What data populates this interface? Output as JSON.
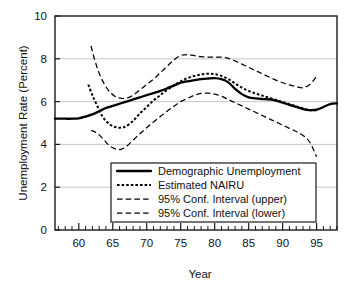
{
  "chart_data": {
    "type": "line",
    "title": "",
    "xlabel": "Year",
    "ylabel": "Unemployment Rate (Percent)",
    "xlim": [
      56.5,
      98.0
    ],
    "ylim": [
      0,
      10
    ],
    "yticks": [
      0,
      2,
      4,
      6,
      8,
      10
    ],
    "ytick_labels": [
      "0",
      "2",
      "4",
      "6",
      "8",
      "10"
    ],
    "xticks": [
      60,
      65,
      70,
      75,
      80,
      85,
      90,
      95
    ],
    "xtick_labels": [
      "60",
      "65",
      "70",
      "75",
      "80",
      "85",
      "90",
      "95"
    ],
    "xminor_step": 1,
    "grid": "horizontal",
    "legend_position": "lower-center",
    "series": [
      {
        "name": "Demographic Unemployment",
        "style": "solid",
        "x": [
          56.5,
          58,
          59,
          60,
          61,
          62,
          63,
          64,
          65,
          66,
          67,
          68,
          69,
          70,
          71,
          72,
          73,
          74,
          75,
          76,
          77,
          78,
          79,
          80,
          81,
          82,
          83,
          84,
          85,
          86,
          87,
          88,
          89,
          90,
          91,
          92,
          93,
          94,
          95,
          96,
          97,
          98
        ],
        "y": [
          5.2,
          5.2,
          5.2,
          5.22,
          5.3,
          5.4,
          5.55,
          5.7,
          5.8,
          5.9,
          6.0,
          6.1,
          6.2,
          6.3,
          6.4,
          6.5,
          6.62,
          6.75,
          6.88,
          6.95,
          7.0,
          7.05,
          7.08,
          7.1,
          7.05,
          6.9,
          6.6,
          6.35,
          6.2,
          6.15,
          6.12,
          6.1,
          6.05,
          5.95,
          5.85,
          5.75,
          5.65,
          5.6,
          5.62,
          5.75,
          5.88,
          5.92
        ]
      },
      {
        "name": "Estimated NAIRU",
        "style": "dotted",
        "x": [
          61.4,
          62,
          62.5,
          63,
          63.5,
          64,
          64.5,
          65,
          65.5,
          66,
          66.5,
          67,
          68,
          69,
          70,
          71,
          72,
          73,
          74,
          75,
          76,
          77,
          78,
          79,
          80,
          81,
          82,
          83,
          84,
          85,
          86,
          87,
          88,
          89,
          90,
          91,
          92,
          93,
          94,
          95
        ],
        "y": [
          6.8,
          6.3,
          5.95,
          5.6,
          5.3,
          5.1,
          4.95,
          4.85,
          4.8,
          4.78,
          4.8,
          4.85,
          5.1,
          5.45,
          5.75,
          6.05,
          6.3,
          6.55,
          6.75,
          6.95,
          7.1,
          7.2,
          7.27,
          7.3,
          7.28,
          7.2,
          7.05,
          6.85,
          6.65,
          6.5,
          6.38,
          6.28,
          6.18,
          6.08,
          5.98,
          5.88,
          5.78,
          5.68,
          5.6,
          5.6
        ]
      },
      {
        "name": "95% Conf. Interval (upper)",
        "style": "dashed",
        "x": [
          61.8,
          62.3,
          62.8,
          63.3,
          63.8,
          64.3,
          64.8,
          65.3,
          65.8,
          66.3,
          67,
          68,
          69,
          70,
          71,
          72,
          73,
          74,
          75,
          76,
          77,
          78,
          79,
          80,
          81,
          82,
          83,
          84,
          85,
          86,
          87,
          88,
          89,
          90,
          91,
          92,
          93,
          94,
          95
        ],
        "y": [
          8.6,
          8.0,
          7.5,
          7.1,
          6.8,
          6.55,
          6.38,
          6.25,
          6.18,
          6.15,
          6.15,
          6.3,
          6.55,
          6.8,
          7.05,
          7.35,
          7.65,
          7.95,
          8.15,
          8.2,
          8.15,
          8.1,
          8.08,
          8.08,
          8.08,
          8.02,
          7.9,
          7.75,
          7.6,
          7.45,
          7.3,
          7.15,
          7.0,
          6.88,
          6.78,
          6.7,
          6.65,
          6.8,
          7.18
        ]
      },
      {
        "name": "95% Conf. Interval (lower)",
        "style": "dashed",
        "x": [
          61.8,
          62.3,
          62.8,
          63.3,
          63.8,
          64.3,
          64.8,
          65.3,
          65.8,
          66.3,
          67,
          68,
          69,
          70,
          71,
          72,
          73,
          74,
          75,
          76,
          77,
          78,
          79,
          80,
          81,
          82,
          83,
          84,
          85,
          86,
          87,
          88,
          89,
          90,
          91,
          92,
          93,
          94,
          95
        ],
        "y": [
          4.65,
          4.6,
          4.5,
          4.35,
          4.18,
          4.0,
          3.88,
          3.8,
          3.76,
          3.78,
          3.9,
          4.2,
          4.5,
          4.78,
          5.05,
          5.3,
          5.55,
          5.78,
          6.0,
          6.15,
          6.3,
          6.38,
          6.4,
          6.35,
          6.25,
          6.1,
          5.95,
          5.8,
          5.65,
          5.5,
          5.35,
          5.2,
          5.05,
          4.9,
          4.75,
          4.6,
          4.42,
          4.1,
          3.42
        ]
      }
    ]
  },
  "legend": {
    "items": [
      {
        "label": "Demographic Unemployment",
        "style": "solid"
      },
      {
        "label": "Estimated NAIRU",
        "style": "dotted"
      },
      {
        "label": "95% Conf. Interval (upper)",
        "style": "dashed"
      },
      {
        "label": "95% Conf. Interval (lower)",
        "style": "dashed"
      }
    ]
  },
  "colors": {
    "series": "#000000",
    "grid": "#b9b9b9",
    "axis": "#1a1a1a",
    "background": "#ffffff"
  }
}
